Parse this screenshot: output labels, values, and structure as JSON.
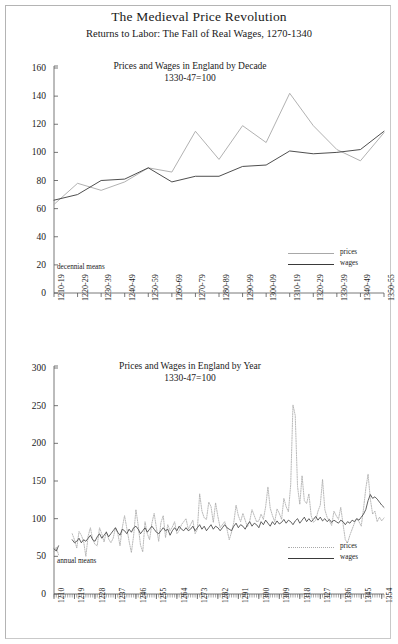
{
  "document": {
    "title": "The Medieval Price Revolution",
    "subtitle": "Returns to Labor: The Fall of Real Wages, 1270-1340"
  },
  "colors": {
    "prices_line": "#a8a8a8",
    "wages_line": "#3a3a3a",
    "axis": "#555555",
    "text": "#1a1a1a",
    "frame": "#c9c9c9"
  },
  "legend": {
    "prices_label": "prices",
    "wages_label": "wages"
  },
  "chart_data": [
    {
      "id": "decade-chart",
      "type": "line",
      "title": "Prices and Wages in England by Decade",
      "subtitle": "1330-47=100",
      "note": "decennial means",
      "xlabel": "",
      "ylabel": "",
      "ylim": [
        0,
        160
      ],
      "yticks": [
        0,
        20,
        40,
        60,
        80,
        100,
        120,
        140,
        160
      ],
      "grid": false,
      "legend_position": "bottom-right",
      "categories": [
        "1210-19",
        "1220-29",
        "1230-39",
        "1240-49",
        "1250-59",
        "1260-69",
        "1270-79",
        "1280-89",
        "1290-99",
        "1300-09",
        "1310-19",
        "1320-29",
        "1330-39",
        "1340-49",
        "1350-55"
      ],
      "series": [
        {
          "name": "prices",
          "values": [
            63,
            78,
            73,
            79,
            89,
            86,
            115,
            95,
            119,
            107,
            142,
            119,
            102,
            94,
            114
          ]
        },
        {
          "name": "wages",
          "values": [
            66,
            70,
            80,
            81,
            89,
            79,
            83,
            83,
            90,
            91,
            101,
            99,
            100,
            102,
            115
          ]
        }
      ]
    },
    {
      "id": "annual-chart",
      "type": "line",
      "title": "Prices and Wages in England by Year",
      "subtitle": "1330-47=100",
      "note": "annual means",
      "xlabel": "",
      "ylabel": "",
      "ylim": [
        0,
        300
      ],
      "yticks": [
        0,
        50,
        100,
        150,
        200,
        250,
        300
      ],
      "grid": false,
      "legend_position": "bottom-right",
      "x_start": 1210,
      "x_end": 1355,
      "xticks": [
        1210,
        1219,
        1228,
        1237,
        1246,
        1255,
        1264,
        1273,
        1282,
        1291,
        1300,
        1309,
        1318,
        1327,
        1336,
        1345,
        1354
      ],
      "series": [
        {
          "name": "prices",
          "x": [
            1210,
            1211,
            1212,
            1218,
            1219,
            1220,
            1221,
            1222,
            1223,
            1224,
            1225,
            1226,
            1227,
            1228,
            1229,
            1230,
            1231,
            1232,
            1233,
            1234,
            1235,
            1236,
            1237,
            1238,
            1239,
            1240,
            1241,
            1242,
            1243,
            1244,
            1245,
            1246,
            1247,
            1248,
            1249,
            1250,
            1251,
            1252,
            1253,
            1254,
            1255,
            1256,
            1257,
            1258,
            1259,
            1260,
            1261,
            1262,
            1263,
            1264,
            1265,
            1266,
            1267,
            1268,
            1269,
            1270,
            1271,
            1272,
            1273,
            1274,
            1275,
            1276,
            1277,
            1278,
            1279,
            1280,
            1281,
            1282,
            1283,
            1284,
            1285,
            1286,
            1287,
            1288,
            1289,
            1290,
            1291,
            1292,
            1293,
            1294,
            1295,
            1296,
            1297,
            1298,
            1299,
            1300,
            1301,
            1302,
            1303,
            1304,
            1305,
            1306,
            1307,
            1308,
            1309,
            1310,
            1311,
            1312,
            1313,
            1314,
            1315,
            1316,
            1317,
            1318,
            1319,
            1320,
            1321,
            1322,
            1323,
            1324,
            1325,
            1326,
            1327,
            1328,
            1329,
            1330,
            1331,
            1332,
            1333,
            1334,
            1335,
            1336,
            1337,
            1338,
            1339,
            1340,
            1341,
            1342,
            1343,
            1344,
            1345,
            1346,
            1347,
            1348,
            1349,
            1350,
            1351,
            1352,
            1353,
            1354,
            1355
          ],
          "values": [
            56,
            62,
            52,
            80,
            72,
            61,
            83,
            78,
            70,
            50,
            77,
            88,
            72,
            66,
            64,
            88,
            80,
            69,
            83,
            73,
            68,
            74,
            88,
            81,
            64,
            88,
            104,
            87,
            70,
            55,
            78,
            112,
            91,
            65,
            56,
            96,
            80,
            72,
            94,
            107,
            88,
            70,
            95,
            104,
            75,
            92,
            84,
            89,
            96,
            80,
            84,
            92,
            96,
            100,
            86,
            92,
            98,
            80,
            86,
            133,
            110,
            101,
            99,
            122,
            116,
            95,
            121,
            103,
            88,
            92,
            96,
            86,
            72,
            82,
            95,
            118,
            104,
            96,
            107,
            98,
            89,
            97,
            112,
            104,
            96,
            97,
            106,
            99,
            116,
            142,
            114,
            104,
            96,
            113,
            107,
            99,
            127,
            116,
            109,
            145,
            251,
            237,
            143,
            119,
            157,
            124,
            120,
            133,
            104,
            95,
            98,
            110,
            118,
            152,
            112,
            102,
            97,
            91,
            110,
            104,
            99,
            115,
            93,
            72,
            68,
            78,
            86,
            94,
            100,
            96,
            90,
            113,
            140,
            159,
            126,
            106,
            110,
            96,
            102,
            97,
            101
          ]
        },
        {
          "name": "wages",
          "x": [
            1210,
            1211,
            1212,
            1218,
            1219,
            1220,
            1221,
            1222,
            1223,
            1224,
            1225,
            1226,
            1227,
            1228,
            1229,
            1230,
            1231,
            1232,
            1233,
            1234,
            1235,
            1236,
            1237,
            1238,
            1239,
            1240,
            1241,
            1242,
            1243,
            1244,
            1245,
            1246,
            1247,
            1248,
            1249,
            1250,
            1251,
            1252,
            1253,
            1254,
            1255,
            1256,
            1257,
            1258,
            1259,
            1260,
            1261,
            1262,
            1263,
            1264,
            1265,
            1266,
            1267,
            1268,
            1269,
            1270,
            1271,
            1272,
            1273,
            1274,
            1275,
            1276,
            1277,
            1278,
            1279,
            1280,
            1281,
            1282,
            1283,
            1284,
            1285,
            1286,
            1287,
            1288,
            1289,
            1290,
            1291,
            1292,
            1293,
            1294,
            1295,
            1296,
            1297,
            1298,
            1299,
            1300,
            1301,
            1302,
            1303,
            1304,
            1305,
            1306,
            1307,
            1308,
            1309,
            1310,
            1311,
            1312,
            1313,
            1314,
            1315,
            1316,
            1317,
            1318,
            1319,
            1320,
            1321,
            1322,
            1323,
            1324,
            1325,
            1326,
            1327,
            1328,
            1329,
            1330,
            1331,
            1332,
            1333,
            1334,
            1335,
            1336,
            1337,
            1338,
            1339,
            1340,
            1341,
            1342,
            1343,
            1344,
            1345,
            1346,
            1347,
            1348,
            1349,
            1350,
            1351,
            1352,
            1353,
            1354,
            1355
          ],
          "values": [
            60,
            57,
            64,
            72,
            68,
            70,
            74,
            68,
            72,
            70,
            74,
            78,
            72,
            70,
            76,
            80,
            74,
            78,
            82,
            76,
            80,
            84,
            88,
            82,
            78,
            86,
            84,
            80,
            86,
            82,
            88,
            90,
            86,
            80,
            84,
            88,
            82,
            86,
            90,
            86,
            82,
            80,
            84,
            88,
            84,
            86,
            78,
            84,
            88,
            84,
            90,
            86,
            84,
            88,
            84,
            86,
            90,
            84,
            88,
            92,
            86,
            90,
            84,
            88,
            92,
            86,
            90,
            88,
            84,
            88,
            92,
            88,
            86,
            84,
            90,
            94,
            88,
            92,
            90,
            86,
            92,
            96,
            90,
            94,
            92,
            88,
            96,
            92,
            98,
            94,
            90,
            96,
            92,
            97,
            93,
            95,
            99,
            94,
            98,
            96,
            92,
            97,
            100,
            94,
            98,
            102,
            96,
            100,
            96,
            99,
            103,
            98,
            102,
            97,
            100,
            96,
            99,
            95,
            98,
            96,
            94,
            98,
            96,
            92,
            96,
            94,
            98,
            96,
            100,
            98,
            102,
            106,
            112,
            124,
            132,
            127,
            129,
            126,
            122,
            118,
            115
          ]
        }
      ]
    }
  ]
}
